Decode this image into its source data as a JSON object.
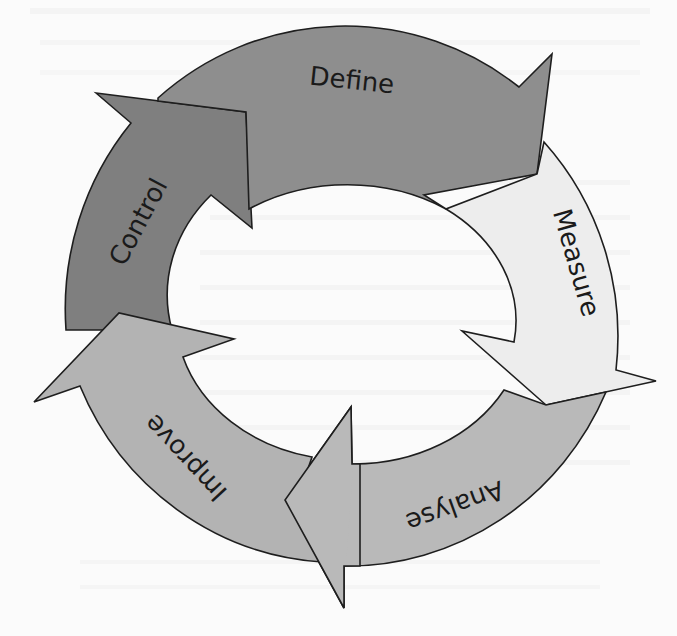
{
  "diagram": {
    "type": "cycle",
    "steps": [
      {
        "id": "define",
        "label": "Define",
        "color": "#8e8e8e"
      },
      {
        "id": "measure",
        "label": "Measure",
        "color": "#ededed"
      },
      {
        "id": "analyse",
        "label": "Analyse",
        "color": "#b9b9b9"
      },
      {
        "id": "improve",
        "label": "Improve",
        "color": "#b3b3b3"
      },
      {
        "id": "control",
        "label": "Control",
        "color": "#7f7f7f"
      }
    ],
    "flow": [
      "define",
      "measure",
      "analyse",
      "improve",
      "control",
      "define"
    ],
    "outline_color": "#1e1e1e",
    "background": "#fbfbfb"
  }
}
